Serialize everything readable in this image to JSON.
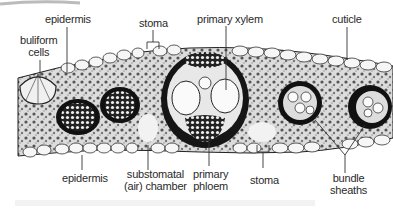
{
  "diagram": {
    "labels": {
      "epidermis_top": "epidermis",
      "buliform_line1": "buliform",
      "buliform_line2": "cells",
      "stoma_top": "stoma",
      "primary_xylem": "primary xylem",
      "cuticle": "cuticle",
      "epidermis_bottom": "epidermis",
      "substomatal_line1": "substomatal",
      "substomatal_line2": "(air) chamber",
      "phloem_line1": "primary",
      "phloem_line2": "phloem",
      "stoma_bottom": "stoma",
      "bundle_line1": "bundle",
      "bundle_line2": "sheaths"
    },
    "colors": {
      "ink": "#1a1a1a",
      "cell_fill": "#f4f4f4",
      "tissue": "#3a3a3a",
      "label_text": "#2a2a2a",
      "leader_line": "#333333"
    }
  }
}
